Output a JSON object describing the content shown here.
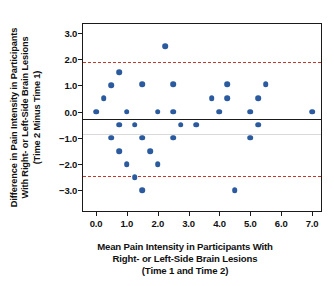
{
  "chart_data": {
    "type": "scatter",
    "title": "",
    "xlabel": "Mean Pain Intensity in Participants With Right- or Left-Side Brain Lesions (Time 1 and Time 2)",
    "ylabel": "Difference in Pain Intensity in Participants With Right- or Left-Side Brain Lesions (Time 2 Minus Time 1)",
    "xlim": [
      -0.42,
      7.29
    ],
    "ylim": [
      -3.79,
      3.34
    ],
    "xticks": [
      0.0,
      1.0,
      2.0,
      3.0,
      4.0,
      5.0,
      6.0,
      7.0
    ],
    "xticklabels": [
      "0.0",
      "1.0",
      "2.0",
      "3.0",
      "4.0",
      "5.0",
      "6.0",
      "7.0"
    ],
    "yticks": [
      3.0,
      2.0,
      1.0,
      0.0,
      -1.0,
      -2.0,
      -3.0
    ],
    "yticklabels": [
      "3.0",
      "2.0",
      "1.0",
      "0.0",
      "−1.0",
      "−2.0",
      "−3.0"
    ],
    "grid": false,
    "legend": "none",
    "marker_color": "#2b5b9e",
    "marker_size": 5.6,
    "reference_lines": [
      {
        "name": "upper-limit-of-agreement",
        "y": 1.9,
        "style": "dashed",
        "color": "#c0392b"
      },
      {
        "name": "mean-difference",
        "y": -0.29,
        "style": "solid",
        "color": "#1a1a1a"
      },
      {
        "name": "gridline",
        "y": -0.85,
        "style": "solid",
        "color": "#d9d9d9"
      },
      {
        "name": "lower-limit-of-agreement",
        "y": -2.47,
        "style": "dashed",
        "color": "#c0392b"
      }
    ],
    "points": [
      {
        "x": 0.0,
        "y": 0.0
      },
      {
        "x": 0.25,
        "y": 0.5
      },
      {
        "x": 0.5,
        "y": 1.0
      },
      {
        "x": 0.5,
        "y": -1.0
      },
      {
        "x": 0.75,
        "y": 1.5
      },
      {
        "x": 0.75,
        "y": -0.5
      },
      {
        "x": 0.75,
        "y": -1.5
      },
      {
        "x": 1.0,
        "y": 0.0
      },
      {
        "x": 1.0,
        "y": -2.0
      },
      {
        "x": 1.25,
        "y": -0.5
      },
      {
        "x": 1.25,
        "y": -2.5
      },
      {
        "x": 1.5,
        "y": -1.0
      },
      {
        "x": 1.5,
        "y": 1.05
      },
      {
        "x": 1.5,
        "y": -3.0
      },
      {
        "x": 1.75,
        "y": -1.5
      },
      {
        "x": 2.0,
        "y": 0.0
      },
      {
        "x": 2.0,
        "y": -2.0
      },
      {
        "x": 2.25,
        "y": 2.5
      },
      {
        "x": 2.5,
        "y": 1.05
      },
      {
        "x": 2.5,
        "y": 0.0
      },
      {
        "x": 2.5,
        "y": -1.0
      },
      {
        "x": 2.75,
        "y": -0.5
      },
      {
        "x": 3.25,
        "y": -0.5
      },
      {
        "x": 3.75,
        "y": 0.5
      },
      {
        "x": 4.0,
        "y": 0.0
      },
      {
        "x": 4.25,
        "y": 0.5
      },
      {
        "x": 4.25,
        "y": 1.05
      },
      {
        "x": 4.5,
        "y": -3.0
      },
      {
        "x": 5.0,
        "y": 0.0
      },
      {
        "x": 5.0,
        "y": -1.0
      },
      {
        "x": 5.25,
        "y": 0.5
      },
      {
        "x": 5.25,
        "y": -0.5
      },
      {
        "x": 5.5,
        "y": 1.05
      },
      {
        "x": 7.0,
        "y": 0.0
      }
    ]
  },
  "axis_titles": {
    "y_lines": [
      "Difference in Pain Intensity in Participants",
      "With Right- or Left-Side Brain Lesions",
      "(Time 2 Minus Time 1)"
    ],
    "x_lines": [
      "Mean Pain Intensity in Participants With",
      "Right- or Left-Side Brain Lesions",
      "(Time 1 and Time 2)"
    ]
  }
}
